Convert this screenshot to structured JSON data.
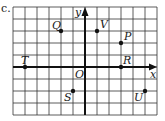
{
  "figure": {
    "prefix_label": "c.",
    "axis_labels": {
      "x": "x",
      "y": "y",
      "origin": "O"
    },
    "grid": {
      "x_range": [
        -6,
        6
      ],
      "y_range": [
        -4,
        5
      ],
      "step": 1
    },
    "colors": {
      "grid": "#333333",
      "axis": "#111111",
      "point": "#111111"
    }
  },
  "chart_data": {
    "type": "scatter",
    "title": "",
    "xlabel": "x",
    "ylabel": "y",
    "xlim": [
      -6,
      6
    ],
    "ylim": [
      -4,
      5
    ],
    "grid": true,
    "points": [
      {
        "label": "T",
        "x": -5,
        "y": 0
      },
      {
        "label": "Q",
        "x": -2,
        "y": 3
      },
      {
        "label": "V",
        "x": 1,
        "y": 3
      },
      {
        "label": "P",
        "x": 3,
        "y": 2
      },
      {
        "label": "R",
        "x": 3,
        "y": 0
      },
      {
        "label": "S",
        "x": -1,
        "y": -2
      },
      {
        "label": "U",
        "x": 5,
        "y": -2
      }
    ]
  }
}
